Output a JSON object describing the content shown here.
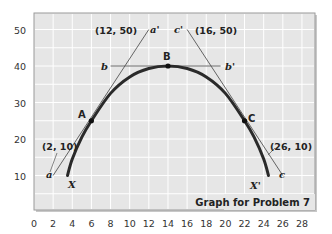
{
  "chart_data": {
    "type": "line",
    "title": "Graph for Problem 7",
    "xlabel": "",
    "ylabel": "",
    "xlim": [
      0,
      28
    ],
    "ylim": [
      0,
      55
    ],
    "grid": true,
    "x_ticks": [
      0,
      2,
      4,
      6,
      8,
      10,
      12,
      14,
      16,
      18,
      20,
      22,
      24,
      26,
      28
    ],
    "y_ticks": [
      10,
      20,
      30,
      40,
      50
    ],
    "series": [
      {
        "name": "curve XX'",
        "style": "thick",
        "x": [
          3.5,
          4,
          5,
          6,
          8,
          10,
          12,
          14,
          16,
          18,
          20,
          22,
          23,
          24,
          24.5
        ],
        "y": [
          10,
          14.5,
          20.5,
          25,
          32.5,
          37,
          39.3,
          40,
          39.3,
          37,
          32.5,
          25,
          20.5,
          14.5,
          10
        ]
      },
      {
        "name": "tangent aa'",
        "style": "thin",
        "x": [
          2,
          12
        ],
        "y": [
          10,
          50
        ]
      },
      {
        "name": "tangent bb'",
        "style": "thin",
        "x": [
          8,
          19.5
        ],
        "y": [
          40,
          40
        ]
      },
      {
        "name": "tangent cc'",
        "style": "thin",
        "x": [
          16,
          26
        ],
        "y": [
          50,
          10
        ]
      }
    ],
    "points": [
      {
        "label": "A",
        "x": 6,
        "y": 25
      },
      {
        "label": "B",
        "x": 14,
        "y": 40
      },
      {
        "label": "C",
        "x": 22,
        "y": 25
      }
    ],
    "annotations": [
      {
        "text": "(12, 50)",
        "x": 12,
        "y": 50
      },
      {
        "text": "(16, 50)",
        "x": 16,
        "y": 50
      },
      {
        "text": "(2, 10)",
        "x": 2,
        "y": 10
      },
      {
        "text": "(26, 10)",
        "x": 26,
        "y": 10
      },
      {
        "text": "a",
        "x": 2,
        "y": 10
      },
      {
        "text": "a'",
        "x": 12,
        "y": 50
      },
      {
        "text": "b",
        "x": 8,
        "y": 40
      },
      {
        "text": "b'",
        "x": 19.5,
        "y": 40
      },
      {
        "text": "c'",
        "x": 16,
        "y": 50
      },
      {
        "text": "c",
        "x": 26,
        "y": 10
      },
      {
        "text": "X",
        "x": 3.5,
        "y": 10
      },
      {
        "text": "X'",
        "x": 24.5,
        "y": 10
      }
    ]
  },
  "labels": {
    "y_ticks": [
      "50",
      "40",
      "30",
      "20",
      "10"
    ],
    "x_ticks": [
      "0",
      "2",
      "4",
      "6",
      "8",
      "10",
      "12",
      "14",
      "16",
      "18",
      "20",
      "22",
      "24",
      "26",
      "28"
    ],
    "coord_12_50": "(12, 50)",
    "coord_16_50": "(16, 50)",
    "coord_2_10": "(2, 10)",
    "coord_26_10": "(26, 10)",
    "point_a": "A",
    "point_b": "B",
    "point_c": "C",
    "line_a": "a",
    "line_a_prime": "a'",
    "line_b": "b",
    "line_b_prime": "b'",
    "line_c": "c",
    "line_c_prime": "c'",
    "end_x": "X",
    "end_x_prime": "X'",
    "caption": "Graph for Problem 7"
  },
  "colors": {
    "plot_bg": "#e6e6e6",
    "grid": "#ffffff",
    "frame": "#9a9a9a",
    "curve": "#2a2a2a",
    "tangent": "#555555"
  }
}
